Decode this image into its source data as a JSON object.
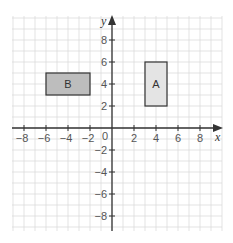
{
  "chart_data": {
    "type": "coordinate-grid",
    "xlabel": "x",
    "ylabel": "y",
    "origin_label": "0",
    "xlim": [
      -9,
      10
    ],
    "ylim": [
      -9,
      10
    ],
    "grid": true,
    "x_ticks": [
      -8,
      -6,
      -4,
      -2,
      2,
      4,
      6,
      8
    ],
    "y_ticks": [
      8,
      6,
      4,
      2,
      -2,
      -4,
      -6,
      -8
    ],
    "x_tick_labels": [
      "−8",
      "−6",
      "−4",
      "−2",
      "2",
      "4",
      "6",
      "8"
    ],
    "y_tick_labels": [
      "8",
      "6",
      "4",
      "2",
      "−2",
      "−4",
      "−6",
      "−8"
    ],
    "shapes": [
      {
        "label": "A",
        "x_min": 3,
        "x_max": 5,
        "y_min": 2,
        "y_max": 6,
        "fill": "#e4e4e4"
      },
      {
        "label": "B",
        "x_min": -6,
        "x_max": -2,
        "y_min": 3,
        "y_max": 5,
        "fill": "#bdbdbd"
      }
    ]
  },
  "colors": {
    "grid": "#dcdcdc",
    "axis": "#333333",
    "shape_stroke": "#333333"
  }
}
